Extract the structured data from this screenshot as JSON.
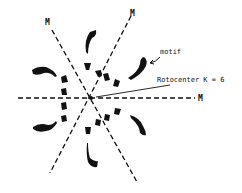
{
  "figure": {
    "title": "",
    "labels": {
      "mirror_top_left": "M",
      "mirror_top_right": "M",
      "mirror_right": "M",
      "motif": "motif",
      "rotocenter": "Rotocenter K = 6"
    },
    "colors": {
      "ink": "#111111",
      "background": "#ffffff"
    },
    "elements": {
      "mirror_lines": 3,
      "rotation_order": 6,
      "outer_motifs": 8,
      "inner_motifs": 12
    }
  }
}
